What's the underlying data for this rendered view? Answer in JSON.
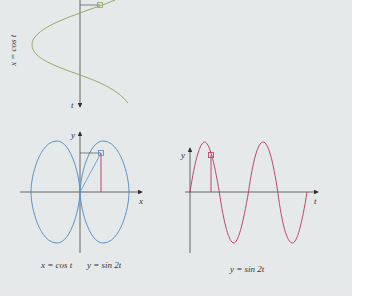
{
  "figure": {
    "colors": {
      "background": "#e6e9ea",
      "axis": "#444444",
      "cos_curve": "#8fae6a",
      "lissajous_curve": "#5b93c9",
      "sine_curve": "#c0466a",
      "projection_line": "#c0466a",
      "guide_line": "#555555"
    },
    "top_panel": {
      "curve_label": "x = cos t",
      "axis_label_t": "t"
    },
    "left_panel": {
      "axis_label_x": "x",
      "axis_label_y": "y",
      "caption_x": "x = cos t",
      "caption_y": "y = sin 2t"
    },
    "right_panel": {
      "axis_label_t": "t",
      "axis_label_y": "y",
      "caption": "y = sin 2t"
    }
  }
}
